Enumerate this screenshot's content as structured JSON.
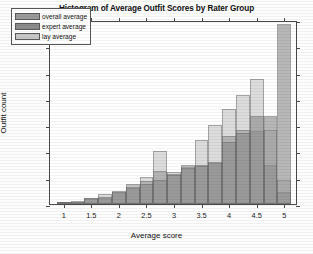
{
  "chart_data": {
    "type": "bar",
    "title": "Histogram of Average Outfit Scores by Rater Group",
    "xlabel": "Average score",
    "ylabel": "Outfit count",
    "xlim": [
      0.75,
      5.25
    ],
    "ylim": [
      0,
      350
    ],
    "grid": false,
    "legend_position": "upper left",
    "xticks": [
      1,
      1.5,
      2,
      2.5,
      3,
      3.5,
      4,
      4.5,
      5
    ],
    "xtick_labels": [
      "1",
      "1.5",
      "2",
      "2.5",
      "3",
      "3.5",
      "4",
      "4.5",
      "5"
    ],
    "yticks": [
      0,
      50,
      100,
      150,
      200,
      250,
      300,
      350
    ],
    "ytick_labels": [
      "0",
      "50",
      "100",
      "150",
      "200",
      "250",
      "300",
      "350"
    ],
    "bin_edges": [
      0.875,
      1.125,
      1.375,
      1.625,
      1.875,
      2.125,
      2.375,
      2.625,
      2.875,
      3.125,
      3.375,
      3.625,
      3.875,
      4.125,
      4.375,
      4.625,
      4.875,
      5.125
    ],
    "bin_centers": [
      1.0,
      1.25,
      1.5,
      1.75,
      2.0,
      2.25,
      2.5,
      2.75,
      3.0,
      3.25,
      3.5,
      3.75,
      4.0,
      4.25,
      4.5,
      4.75,
      5.0
    ],
    "series": [
      {
        "name": "overall average",
        "color": "#9a9a9a",
        "values": [
          3,
          4,
          10,
          12,
          22,
          38,
          43,
          62,
          58,
          75,
          75,
          78,
          130,
          140,
          138,
          75,
          22
        ]
      },
      {
        "name": "expert average",
        "color": "#8c8c8c",
        "values": [
          4,
          5,
          12,
          14,
          25,
          30,
          38,
          45,
          55,
          68,
          72,
          80,
          118,
          136,
          168,
          168,
          343
        ]
      },
      {
        "name": "lay average",
        "color": "#c8c8c8",
        "values": [
          3,
          4,
          11,
          20,
          22,
          33,
          52,
          100,
          60,
          70,
          122,
          150,
          180,
          208,
          238,
          140,
          45
        ]
      }
    ]
  }
}
